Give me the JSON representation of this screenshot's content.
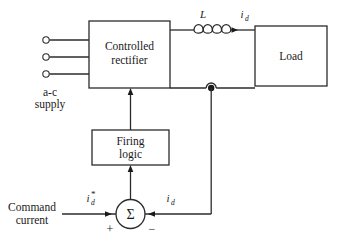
{
  "diagram": {
    "background_color": "#ffffff",
    "line_color": "#2b2b2b",
    "text_color": "#1a1a1a"
  },
  "blocks": {
    "controlled_rectifier": {
      "line1": "Controlled",
      "line2": "rectifier"
    },
    "load": {
      "label": "Load"
    },
    "firing_logic": {
      "line1": "Firing",
      "line2": "logic"
    },
    "summing_junction": {
      "label": "Σ",
      "plus_sign": "+",
      "minus_sign": "−"
    }
  },
  "labels": {
    "ac_supply_line1": "a-c",
    "ac_supply_line2": "supply",
    "inductor": "L",
    "current_top_base": "i",
    "current_top_sub": "d",
    "command_line1": "Command",
    "command_line2": "current",
    "command_current_base": "i",
    "command_current_sub": "d",
    "command_current_star": "*",
    "feedback_current_base": "i",
    "feedback_current_sub": "d"
  },
  "terminals": {
    "count": 3,
    "name": "ac-supply-terminal"
  }
}
